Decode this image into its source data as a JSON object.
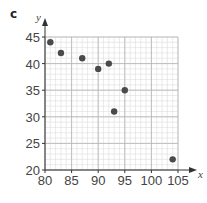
{
  "panel_label": "c",
  "chart_data": {
    "type": "scatter",
    "title": "",
    "xlabel": "x",
    "ylabel": "y",
    "xlim": [
      80,
      105
    ],
    "ylim": [
      20,
      45
    ],
    "xticks": [
      80,
      85,
      90,
      95,
      100,
      105
    ],
    "yticks": [
      20,
      25,
      30,
      35,
      40,
      45
    ],
    "grid": true,
    "minor_grid_step": 1,
    "points": [
      {
        "x": 81,
        "y": 44
      },
      {
        "x": 83,
        "y": 42
      },
      {
        "x": 87,
        "y": 41
      },
      {
        "x": 90,
        "y": 39
      },
      {
        "x": 92,
        "y": 40
      },
      {
        "x": 93,
        "y": 31
      },
      {
        "x": 95,
        "y": 35
      },
      {
        "x": 104,
        "y": 22
      }
    ],
    "colors": {
      "point": "#4a4a4a",
      "major_grid": "#b8b8b8",
      "minor_grid": "#dedede",
      "axis": "#333333"
    }
  }
}
